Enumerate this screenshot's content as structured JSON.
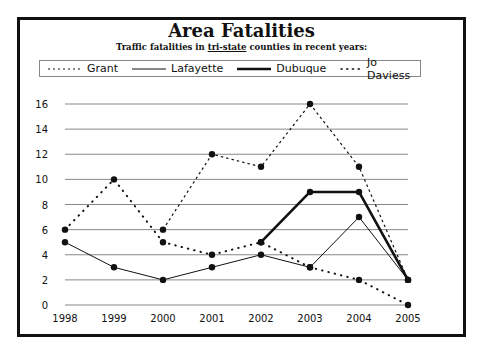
{
  "chart_data": {
    "type": "line",
    "title": "Area Fatalities",
    "subtitle_parts": [
      "Traffic fatalities in ",
      "tri-state",
      " counties in recent years:"
    ],
    "xlabel": "",
    "ylabel": "",
    "x": [
      1998,
      1999,
      2000,
      2001,
      2002,
      2003,
      2004,
      2005
    ],
    "ylim": [
      0,
      16
    ],
    "yticks": [
      0,
      2,
      4,
      6,
      8,
      10,
      12,
      14,
      16
    ],
    "grid": true,
    "legend_position": "top",
    "series": [
      {
        "name": "Grant",
        "style": "dashed",
        "values": [
          null,
          null,
          6,
          12,
          11,
          16,
          11,
          2
        ]
      },
      {
        "name": "Lafayette",
        "style": "thin-solid",
        "values": [
          5,
          3,
          2,
          3,
          4,
          3,
          7,
          2
        ]
      },
      {
        "name": "Dubuque",
        "style": "thick-solid",
        "values": [
          null,
          null,
          null,
          null,
          5,
          9,
          9,
          2
        ]
      },
      {
        "name": "Jo Daviess",
        "style": "dotted",
        "values": [
          6,
          10,
          5,
          4,
          5,
          3,
          2,
          0
        ]
      }
    ]
  },
  "legend": {
    "items": [
      {
        "label": "Grant"
      },
      {
        "label": "Lafayette"
      },
      {
        "label": "Dubuque"
      },
      {
        "label": "Jo Daviess"
      }
    ]
  }
}
